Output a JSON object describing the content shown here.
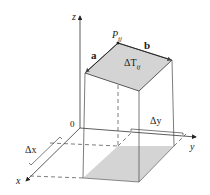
{
  "diagram": {
    "axes": {
      "x": "x",
      "y": "y",
      "z": "z",
      "origin": "0"
    },
    "point_label": "P",
    "point_subscript": "ij",
    "vectors": {
      "a": "a",
      "b": "b"
    },
    "patch_label": "ΔT",
    "patch_subscript": "ij",
    "delta_x": "Δx",
    "delta_y": "Δy",
    "colors": {
      "shade": "#d4d4d4",
      "line": "#333333"
    }
  }
}
